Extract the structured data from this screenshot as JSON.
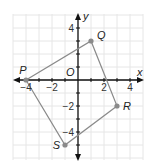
{
  "diagram": {
    "type": "coordinate-plane-quadrilateral",
    "axes": {
      "x_label": "x",
      "y_label": "y",
      "origin_label": "O",
      "x_ticks": [
        {
          "value": -4,
          "label": "−4"
        },
        {
          "value": -2,
          "label": "−2"
        },
        {
          "value": 2,
          "label": "2"
        },
        {
          "value": 4,
          "label": "4"
        }
      ],
      "y_ticks": [
        {
          "value": 4,
          "label": "4"
        },
        {
          "value": -2,
          "label": "−2"
        },
        {
          "value": -4,
          "label": "−4"
        }
      ],
      "x_range": [
        -5,
        5
      ],
      "y_range": [
        -6,
        5
      ],
      "grid": true
    },
    "points": [
      {
        "name": "P",
        "x": -4,
        "y": 0
      },
      {
        "name": "Q",
        "x": 1,
        "y": 3
      },
      {
        "name": "R",
        "x": 3,
        "y": -2
      },
      {
        "name": "S",
        "x": -1,
        "y": -5
      }
    ],
    "polygon": [
      "P",
      "Q",
      "R",
      "S"
    ],
    "colors": {
      "grid": "#e6e6e6",
      "axis": "#111111",
      "edge": "#8a8a8a",
      "point": "#8a8a8a"
    }
  }
}
